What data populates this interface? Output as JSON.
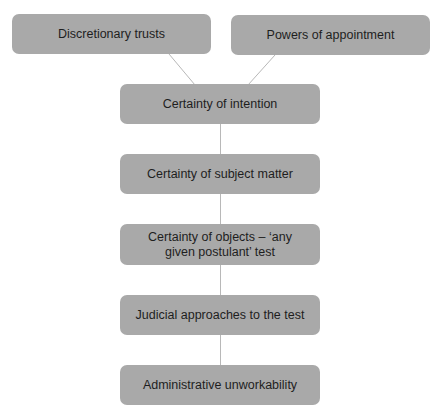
{
  "diagram": {
    "type": "flowchart",
    "colors": {
      "node_fill": "#a9a9a9",
      "node_text": "#1e1e1e",
      "connector": "#b8b8b8",
      "background": "#ffffff"
    },
    "nodes": [
      {
        "id": "discretionary-trusts",
        "label": "Discretionary trusts"
      },
      {
        "id": "powers-of-appointment",
        "label": "Powers of appointment"
      },
      {
        "id": "certainty-of-intention",
        "label": "Certainty of intention"
      },
      {
        "id": "certainty-of-subject-matter",
        "label": "Certainty of subject matter"
      },
      {
        "id": "certainty-of-objects",
        "label": "Certainty of objects – ‘any given postulant’ test"
      },
      {
        "id": "judicial-approaches",
        "label": "Judicial approaches to the test"
      },
      {
        "id": "administrative-unworkability",
        "label": "Administrative unworkability"
      }
    ],
    "edges": [
      {
        "from": "discretionary-trusts",
        "to": "certainty-of-intention"
      },
      {
        "from": "powers-of-appointment",
        "to": "certainty-of-intention"
      },
      {
        "from": "certainty-of-intention",
        "to": "certainty-of-subject-matter"
      },
      {
        "from": "certainty-of-subject-matter",
        "to": "certainty-of-objects"
      },
      {
        "from": "certainty-of-objects",
        "to": "judicial-approaches"
      },
      {
        "from": "judicial-approaches",
        "to": "administrative-unworkability"
      }
    ]
  }
}
